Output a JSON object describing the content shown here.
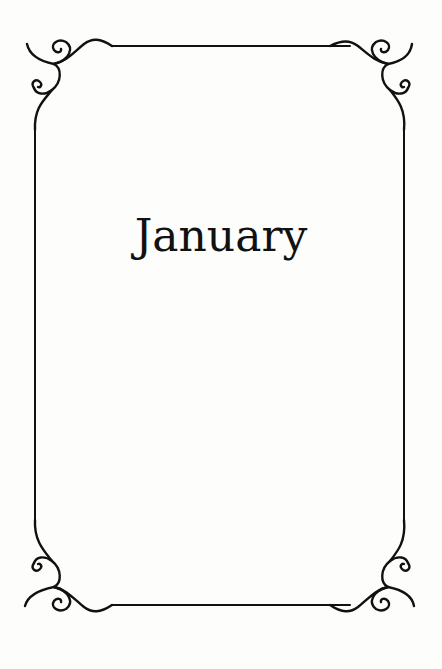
{
  "page": {
    "title": "January"
  },
  "frame": {
    "style": "ornamental-border",
    "stroke_color": "#111111",
    "background": "#fdfdfc"
  }
}
